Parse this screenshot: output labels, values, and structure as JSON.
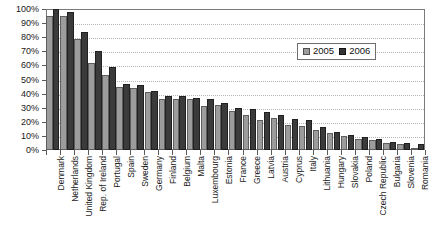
{
  "chart_data": {
    "type": "bar",
    "title": "",
    "xlabel": "",
    "ylabel": "",
    "ylim": [
      0,
      100
    ],
    "ytick_labels": [
      "100%",
      "90%",
      "80%",
      "70%",
      "60%",
      "50%",
      "40%",
      "30%",
      "20%",
      "10%",
      "0%"
    ],
    "ytick_values": [
      100,
      90,
      80,
      70,
      60,
      50,
      40,
      30,
      20,
      10,
      0
    ],
    "grid": true,
    "legend_position": "top-right",
    "categories": [
      "Denmark",
      "Netherlands",
      "United Kingdom",
      "Rep. of Ireland",
      "Portugal",
      "Spain",
      "Sweden",
      "Germany",
      "Finland",
      "Belgium",
      "Malta",
      "Luxembourg",
      "Estonia",
      "France",
      "Greece",
      "Latvia",
      "Austria",
      "Cyprus",
      "Italy",
      "Lithuania",
      "Hungary",
      "Slovakia",
      "Poland",
      "Czech Republic",
      "Bulgaria",
      "Slovenia",
      "Romania"
    ],
    "series": [
      {
        "name": "2005",
        "color": "#9c9c9c",
        "values": [
          95,
          95,
          79,
          62,
          53,
          45,
          44,
          41,
          36,
          36,
          36,
          31,
          32,
          28,
          25,
          21,
          23,
          18,
          17,
          14,
          12,
          10,
          8,
          7,
          5,
          4,
          1
        ]
      },
      {
        "name": "2006",
        "color": "#3b3b3b",
        "values": [
          100,
          98,
          84,
          70,
          59,
          47,
          46,
          42,
          38,
          38,
          37,
          36,
          33,
          30,
          29,
          27,
          25,
          22,
          21,
          16,
          13,
          11,
          9,
          8,
          6,
          5,
          4
        ]
      }
    ]
  },
  "legend": {
    "items": [
      {
        "label": "2005"
      },
      {
        "label": "2006"
      }
    ]
  }
}
